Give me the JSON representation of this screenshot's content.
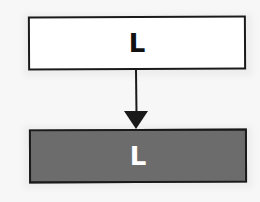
{
  "diagram": {
    "nodes": [
      {
        "id": "top",
        "label": "L",
        "fill": "#ffffff",
        "text_color": "#111111"
      },
      {
        "id": "bottom",
        "label": "L",
        "fill": "#6c6c6c",
        "text_color": "#ffffff"
      }
    ],
    "edges": [
      {
        "from": "top",
        "to": "bottom",
        "style": "arrow",
        "color": "#1a1a1a"
      }
    ]
  }
}
